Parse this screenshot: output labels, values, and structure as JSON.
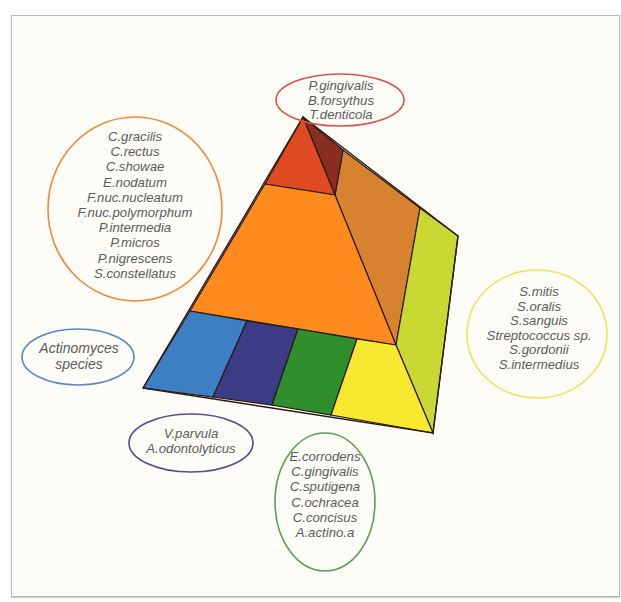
{
  "colors": {
    "background": "#fdfcf7",
    "frame_border": "#b9b9b5",
    "outline": "#2a1a10",
    "text": "#5b5b5b",
    "red_complex": "#e04a22",
    "red_complex_side": "#8a2e22",
    "orange_complex": "#ff8a1e",
    "orange_complex_side": "#d7822e",
    "yellow_complex": "#f7e830",
    "yellow_complex_side": "#c9d832",
    "actinomyces_blue": "#3c7fc4",
    "purple_complex": "#3b3b86",
    "green_complex": "#2f8f2c"
  },
  "diagram": {
    "title": "",
    "groups": [
      {
        "id": "red",
        "ellipse_color": "#d9544e",
        "species": [
          "P.gingivalis",
          "B.forsythus",
          "T.denticola"
        ]
      },
      {
        "id": "orange",
        "ellipse_color": "#f08a3c",
        "species": [
          "C.gracilis",
          "C.rectus",
          "C.showae",
          "E.nodatum",
          "F.nuc.nucleatum",
          "F.nuc.polymorphum",
          "P.intermedia",
          "P.micros",
          "P.nigrescens",
          "S.constellatus"
        ]
      },
      {
        "id": "yellow",
        "ellipse_color": "#ece35a",
        "species": [
          "S.mitis",
          "S.oralis",
          "S.sanguis",
          "Streptococcus sp.",
          "S.gordonii",
          "S.intermedius"
        ]
      },
      {
        "id": "blue",
        "ellipse_color": "#5b86c2",
        "species": [
          "Actinomyces",
          "species"
        ]
      },
      {
        "id": "purple",
        "ellipse_color": "#4e4e8e",
        "species": [
          "V.parvula",
          "A.odontolyticus"
        ]
      },
      {
        "id": "green",
        "ellipse_color": "#5aa05a",
        "species": [
          "E.corrodens",
          "C.gingivalis",
          "C.sputigena",
          "C.ochracea",
          "C.concisus",
          "A.actino.a"
        ]
      }
    ]
  }
}
